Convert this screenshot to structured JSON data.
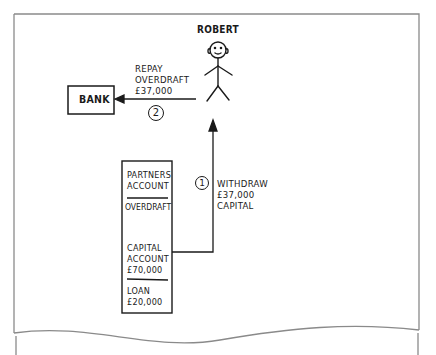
{
  "diagram": {
    "person": {
      "label": "ROBERT",
      "icon": "stick-figure-icon"
    },
    "bank": {
      "label": "BANK"
    },
    "step2": {
      "number": "2",
      "label_lines": [
        "REPAY",
        "OVERDRAFT",
        "£37,000"
      ]
    },
    "step1": {
      "number": "1",
      "label_lines": [
        "WITHDRAW",
        "£37,000",
        "CAPITAL"
      ]
    },
    "account_box": {
      "title_lines": [
        "PARTNERS",
        "ACCOUNT"
      ],
      "overdraft_label": "OVERDRAFT",
      "capital_lines": [
        "CAPITAL",
        "ACCOUNT",
        "£70,000"
      ],
      "loan_lines": [
        "LOAN",
        "£20,000"
      ]
    },
    "colors": {
      "ink": "#1a1a1a",
      "frame": "#8a8a8a",
      "background": "#ffffff"
    }
  }
}
